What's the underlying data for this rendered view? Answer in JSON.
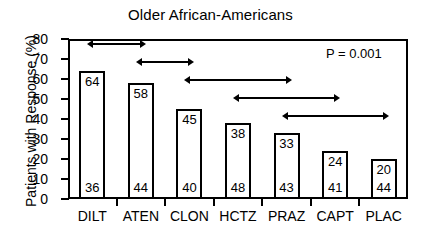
{
  "chart_data": {
    "type": "bar",
    "title": "Older African-Americans",
    "xlabel": "",
    "ylabel": "Patients with Response (%)",
    "ylim": [
      0,
      80
    ],
    "ytick_labels": [
      "80",
      "70",
      "60",
      "50",
      "40",
      "30",
      "20",
      "10",
      "0"
    ],
    "ytick_values": [
      80,
      70,
      60,
      50,
      40,
      30,
      20,
      10,
      0
    ],
    "grid": false,
    "legend": null,
    "categories": [
      "DILT",
      "ATEN",
      "CLON",
      "HCTZ",
      "PRAZ",
      "CAPT",
      "PLAC"
    ],
    "values": [
      64,
      58,
      45,
      38,
      33,
      24,
      20
    ],
    "bar_top_labels": [
      "64",
      "58",
      "45",
      "38",
      "33",
      "24",
      "20"
    ],
    "bar_bottom_labels": [
      "36",
      "44",
      "40",
      "48",
      "43",
      "41",
      "44"
    ],
    "annotations": [
      {
        "text": "P = 0.001",
        "position": "top-right"
      }
    ],
    "significance_brackets": [
      {
        "from": "DILT",
        "to": "ATEN",
        "row": 1
      },
      {
        "from": "ATEN",
        "to": "CLON",
        "row": 2
      },
      {
        "from": "CLON",
        "to": "PRAZ",
        "row": 3
      },
      {
        "from": "HCTZ",
        "to": "CAPT",
        "row": 4
      },
      {
        "from": "PRAZ",
        "to": "PLAC",
        "row": 5
      }
    ],
    "colors": {
      "bar_fill": "#ffffff",
      "bar_stroke": "#000000",
      "axis": "#000000",
      "background": "#ffffff",
      "text": "#000000"
    }
  }
}
